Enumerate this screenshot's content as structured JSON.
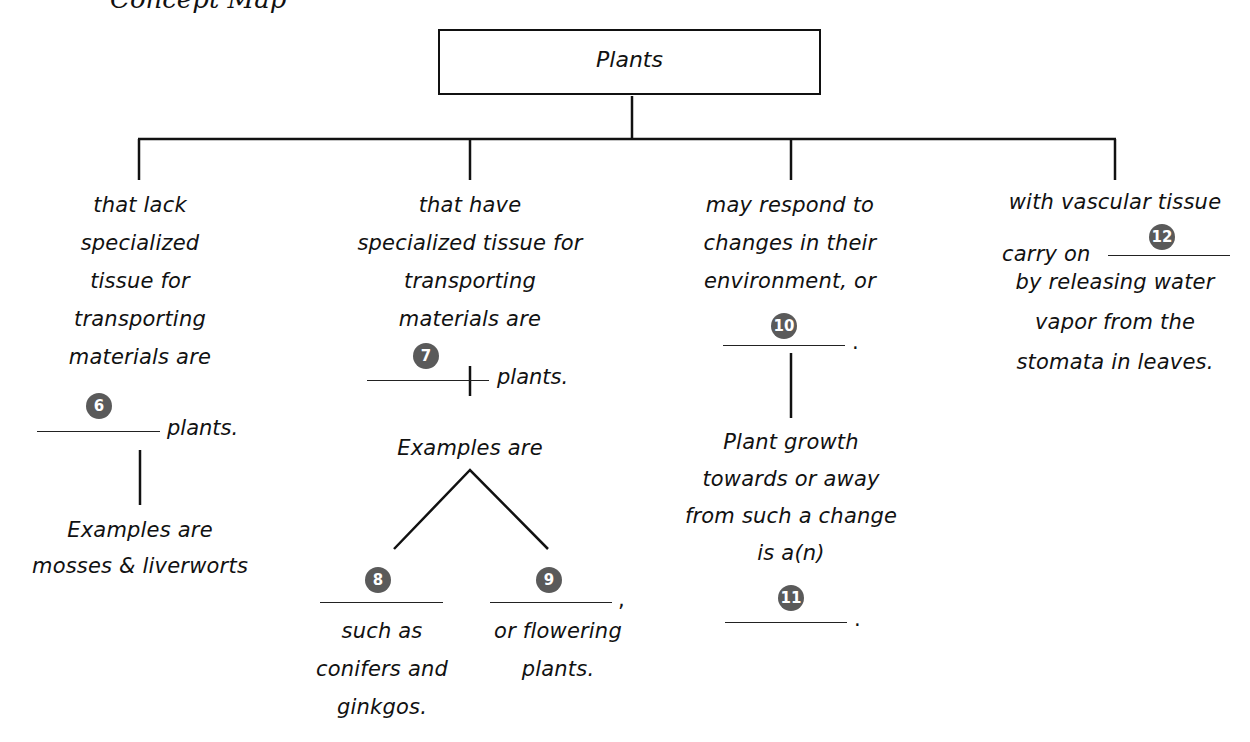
{
  "header": {
    "cutoff_text": "Concept Map"
  },
  "root": {
    "label": "Plants"
  },
  "branches": [
    {
      "lines": [
        "that lack",
        "specialized",
        "tissue for",
        "transporting",
        "materials are"
      ],
      "blank": {
        "number": "6",
        "suffix": "plants."
      },
      "sub": {
        "lines": [
          "Examples are",
          "mosses & liverworts"
        ]
      }
    },
    {
      "lines": [
        "that have",
        "specialized tissue for",
        "transporting",
        "materials are"
      ],
      "blank": {
        "number": "7",
        "suffix": "plants."
      },
      "sub": {
        "intro": "Examples are",
        "children": [
          {
            "number": "8",
            "suffix": "",
            "lines": [
              "such as",
              "conifers and",
              "ginkgos."
            ]
          },
          {
            "number": "9",
            "suffix": ",",
            "lines": [
              "or flowering",
              "plants."
            ]
          }
        ]
      }
    },
    {
      "lines": [
        "may respond to",
        "changes in their",
        "environment, or"
      ],
      "blank": {
        "number": "10",
        "suffix": "."
      },
      "sub": {
        "lines": [
          "Plant growth",
          "towards or away",
          "from such a change",
          "is a(n)"
        ],
        "blank": {
          "number": "11",
          "suffix": "."
        }
      }
    },
    {
      "lines": [
        "with vascular tissue",
        "carry on",
        "by releasing water",
        "vapor from the",
        "stomata in leaves."
      ],
      "blank": {
        "number": "12",
        "suffix": ""
      }
    }
  ],
  "colors": {
    "badge": "#5a5a5a",
    "line": "#111111",
    "background": "#ffffff"
  }
}
